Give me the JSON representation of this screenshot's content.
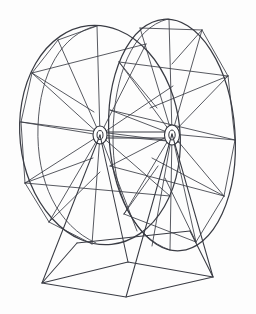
{
  "figure": {
    "title": "Ferris wheel line drawing",
    "style": "monochrome-line-art",
    "background_color": "#fdfdfd",
    "line_color": "#3a3c44",
    "canvas": {
      "width": 256,
      "height": 314
    }
  },
  "geometry": {
    "back_wheel": {
      "label": "rear wheel rim",
      "center": {
        "x": 100,
        "y": 135
      },
      "radius_x": 80,
      "radius_y": 110,
      "tilt_deg": -6,
      "spoke_count": 16
    },
    "front_wheel": {
      "label": "front wheel rim",
      "center": {
        "x": 172,
        "y": 135
      },
      "radius_x": 63,
      "radius_y": 116,
      "tilt_deg": -4,
      "spoke_count": 16
    },
    "hubs": [
      {
        "name": "rear-hub",
        "x": 100,
        "y": 135,
        "rx": 7,
        "ry": 9,
        "inner_rx": 3,
        "inner_ry": 4.5
      },
      {
        "name": "front-hub",
        "x": 172,
        "y": 135,
        "rx": 7.5,
        "ry": 10,
        "inner_rx": 3.2,
        "inner_ry": 5
      }
    ],
    "base": {
      "label": "support base and legs",
      "top_left": {
        "x": 77,
        "y": 243
      },
      "top_right": {
        "x": 190,
        "y": 231
      },
      "ground_left": {
        "x": 42,
        "y": 283
      },
      "ground_front": {
        "x": 126,
        "y": 297
      },
      "ground_right": {
        "x": 213,
        "y": 277
      },
      "ground_back": {
        "x": 128,
        "y": 262
      }
    }
  },
  "elements": {
    "back_rim_label": "Rear wheel outer rim",
    "front_rim_label": "Front wheel outer rim",
    "spokes_label": "Radial spokes",
    "bracing_label": "Diagonal cross bracing",
    "base_label": "Pedestal base frame"
  }
}
